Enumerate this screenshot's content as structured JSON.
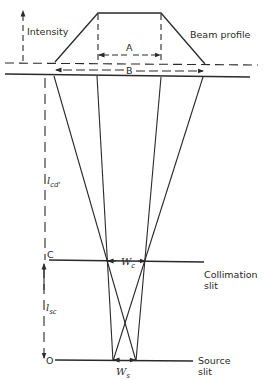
{
  "diagram": {
    "type": "beam collimation geometry",
    "labels": {
      "intensity": "Intensity",
      "beam_profile": "Beam profile",
      "width_a": "A",
      "width_b": "B",
      "distance_cd_symbol": "l",
      "distance_cd_sub": "cd'",
      "distance_sc_symbol": "l",
      "distance_sc_sub": "sc",
      "point_c": "C",
      "point_o": "O",
      "collimation_width_symbol": "W",
      "collimation_width_sub": "c",
      "source_width_symbol": "W",
      "source_width_sub": "s",
      "collimation_slit_line1": "Collimation",
      "collimation_slit_line2": "slit",
      "source_slit_line1": "Source",
      "source_slit_line2": "slit"
    },
    "colors": {
      "stroke": "#2a2a2a",
      "background": "#ffffff"
    }
  }
}
